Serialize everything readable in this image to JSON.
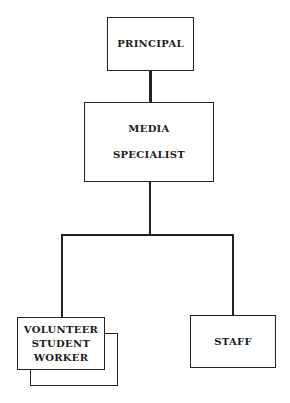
{
  "diagram": {
    "type": "org-chart",
    "nodes": {
      "principal": {
        "label": "PRINCIPAL"
      },
      "media_specialist": {
        "line1": "MEDIA",
        "line2": "SPECIALIST"
      },
      "volunteer": {
        "line1": "VOLUNTEER",
        "line2": "STUDENT",
        "line3": "WORKER"
      },
      "staff": {
        "label": "STAFF"
      }
    },
    "edges": [
      {
        "from": "PRINCIPAL",
        "to": "MEDIA SPECIALIST"
      },
      {
        "from": "MEDIA SPECIALIST",
        "to": "VOLUNTEER STUDENT WORKER"
      },
      {
        "from": "MEDIA SPECIALIST",
        "to": "STAFF"
      }
    ]
  }
}
